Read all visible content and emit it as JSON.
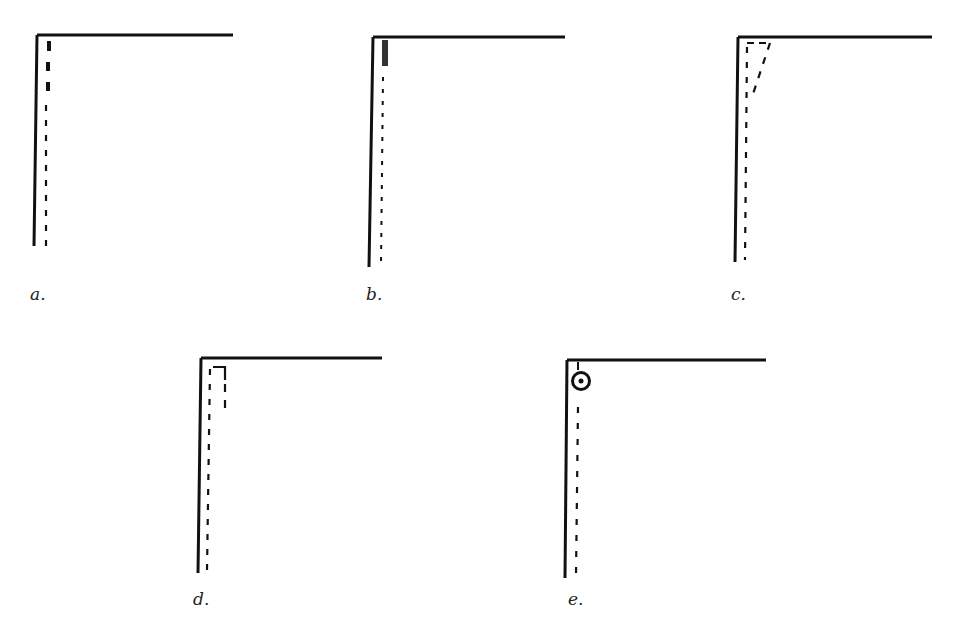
{
  "figure": {
    "panels": [
      {
        "id": "a",
        "label": "a.",
        "variant": "bold-top-dashes"
      },
      {
        "id": "b",
        "label": "b.",
        "variant": "dense-cluster-top"
      },
      {
        "id": "c",
        "label": "c.",
        "variant": "forked-trace"
      },
      {
        "id": "d",
        "label": "d.",
        "variant": "hooked-bracket"
      },
      {
        "id": "e",
        "label": "e.",
        "variant": "circled-point"
      }
    ],
    "colors": {
      "ink": "#111111",
      "background": "#ffffff"
    }
  }
}
